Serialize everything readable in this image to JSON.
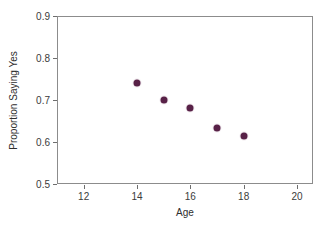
{
  "chart_data": {
    "type": "scatter",
    "title": "",
    "xlabel": "Age",
    "ylabel": "Proportion Saying Yes",
    "xlim": [
      11,
      20.6
    ],
    "ylim": [
      0.5,
      0.9
    ],
    "grid": false,
    "legend": null,
    "marker_color": "#4a1138",
    "frame_color": "#8c8c8c",
    "xticks": [
      "12",
      "14",
      "16",
      "18",
      "20"
    ],
    "xtick_values": [
      12,
      14,
      16,
      18,
      20
    ],
    "yticks": [
      "0.5",
      "0.6",
      "0.7",
      "0.8",
      "0.9"
    ],
    "ytick_values": [
      0.5,
      0.6,
      0.7,
      0.8,
      0.9
    ],
    "x": [
      14,
      15,
      16,
      17,
      18
    ],
    "values": [
      0.741,
      0.7,
      0.681,
      0.633,
      0.614
    ],
    "points": [
      {
        "x": 14,
        "y": 0.741
      },
      {
        "x": 15,
        "y": 0.7
      },
      {
        "x": 16,
        "y": 0.681
      },
      {
        "x": 17,
        "y": 0.633
      },
      {
        "x": 18,
        "y": 0.614
      }
    ]
  }
}
